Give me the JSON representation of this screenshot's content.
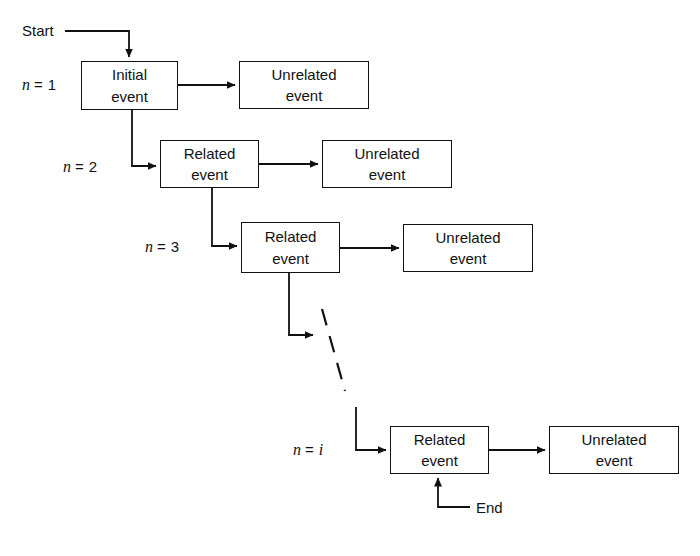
{
  "diagram": {
    "stroke_color": "#111111",
    "background_color": "#ffffff",
    "start_label": "Start",
    "end_label": "End",
    "rows": [
      {
        "index_var": "n",
        "index_eq": "=",
        "index_value": "1",
        "index_italic_value": false,
        "primary": {
          "line1": "Initial",
          "line2": "event"
        },
        "secondary": {
          "line1": "Unrelated",
          "line2": "event"
        }
      },
      {
        "index_var": "n",
        "index_eq": "=",
        "index_value": "2",
        "index_italic_value": false,
        "primary": {
          "line1": "Related",
          "line2": "event"
        },
        "secondary": {
          "line1": "Unrelated",
          "line2": "event"
        }
      },
      {
        "index_var": "n",
        "index_eq": "=",
        "index_value": "3",
        "index_italic_value": false,
        "primary": {
          "line1": "Related",
          "line2": "event"
        },
        "secondary": {
          "line1": "Unrelated",
          "line2": "event"
        }
      },
      {
        "index_var": "n",
        "index_eq": "=",
        "index_value": "i",
        "index_italic_value": true,
        "primary": {
          "line1": "Related",
          "line2": "event"
        },
        "secondary": {
          "line1": "Unrelated",
          "line2": "event"
        }
      }
    ],
    "continuation": {
      "style": "dashed-diagonal",
      "meaning": "sequence continues"
    }
  }
}
